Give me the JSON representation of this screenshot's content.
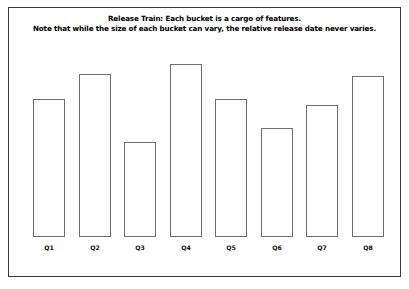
{
  "figure": {
    "background_color": "#ffffff",
    "frame_color": "#3a3a3a",
    "bar_outline_color": "#6e6e6e",
    "bar_fill_color": "#ffffff",
    "title_line_1": "Release Train: Each bucket is a cargo of features.",
    "title_line_2": "Note that while the size of each bucket can vary, the relative release date never varies."
  },
  "chart_data": {
    "type": "bar",
    "title": "Release Train: Each bucket is a cargo of features. Note that while the size of each bucket can vary, the relative release date never varies.",
    "subtitle": "Note that while the size of each bucket can vary, the relative release date never varies.",
    "xlabel": "",
    "ylabel": "",
    "grid": false,
    "legend": false,
    "ylim": [
      0,
      190
    ],
    "categories": [
      "Q1",
      "Q2",
      "Q3",
      "Q4",
      "Q5",
      "Q6",
      "Q7",
      "Q8"
    ],
    "values": [
      138,
      163,
      95,
      173,
      138,
      109,
      132,
      161
    ],
    "series": [
      {
        "name": "Release bucket size",
        "values": [
          138,
          163,
          95,
          173,
          138,
          109,
          132,
          161
        ]
      }
    ],
    "bars": [
      {
        "label": "Q1",
        "value": 138,
        "x_center": 41
      },
      {
        "label": "Q2",
        "value": 163,
        "x_center": 87
      },
      {
        "label": "Q3",
        "value": 95,
        "x_center": 132
      },
      {
        "label": "Q4",
        "value": 173,
        "x_center": 178
      },
      {
        "label": "Q5",
        "value": 138,
        "x_center": 223
      },
      {
        "label": "Q6",
        "value": 109,
        "x_center": 269
      },
      {
        "label": "Q7",
        "value": 132,
        "x_center": 314
      },
      {
        "label": "Q8",
        "value": 161,
        "x_center": 360
      }
    ]
  }
}
